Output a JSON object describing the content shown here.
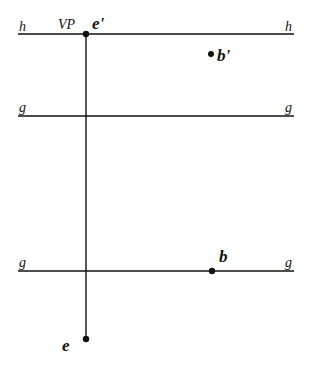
{
  "diagram": {
    "lines": [
      {
        "id": "horizon",
        "label_left": "h",
        "label_right": "h",
        "y": 34,
        "x1": 18,
        "x2": 294
      },
      {
        "id": "ground-upper",
        "label_left": "g",
        "label_right": "g",
        "y": 116,
        "x1": 18,
        "x2": 294
      },
      {
        "id": "ground-lower",
        "label_left": "g",
        "label_right": "g",
        "y": 271,
        "x1": 18,
        "x2": 294
      }
    ],
    "vertical": {
      "id": "sight-line",
      "x": 86,
      "y1": 34,
      "y2": 339
    },
    "points": [
      {
        "id": "e-prime",
        "label": "e'",
        "x": 86,
        "y": 34
      },
      {
        "id": "b-prime",
        "label": "b'",
        "x": 211,
        "y": 54
      },
      {
        "id": "b",
        "label": "b",
        "x": 212,
        "y": 271
      },
      {
        "id": "e",
        "label": "e",
        "x": 86,
        "y": 339
      }
    ],
    "annotations": {
      "vp": "VP"
    },
    "colors": {
      "stroke": "#111111",
      "background": "#ffffff"
    }
  }
}
